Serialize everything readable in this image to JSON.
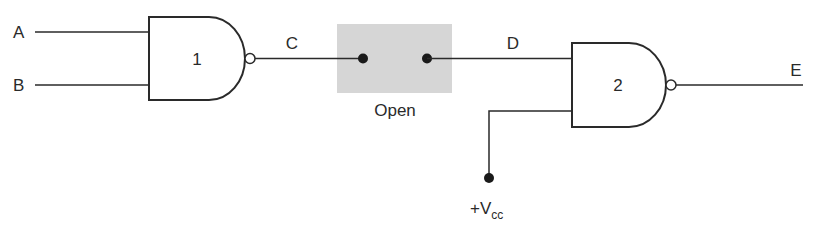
{
  "diagram": {
    "type": "logic-circuit",
    "inputs": {
      "a_label": "A",
      "b_label": "B"
    },
    "gates": [
      {
        "id": "1",
        "label": "1",
        "kind": "NAND"
      },
      {
        "id": "2",
        "label": "2",
        "kind": "NAND"
      }
    ],
    "nodes": {
      "c_label": "C",
      "d_label": "D",
      "e_label": "E"
    },
    "switch": {
      "state_label": "Open",
      "fill_color": "#d6d6d6"
    },
    "supply": {
      "prefix": "+V",
      "subscript": "cc"
    },
    "colors": {
      "line": "#2a2a2a",
      "dot": "#1a1a1a"
    }
  }
}
